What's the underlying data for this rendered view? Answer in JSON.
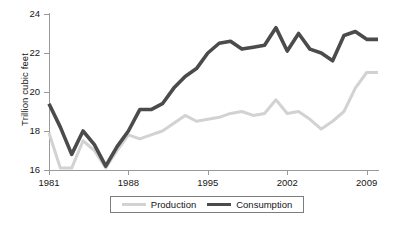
{
  "chart_data": {
    "type": "line",
    "title": "",
    "subtitle": "",
    "xlabel": "",
    "ylabel": "Trillion cubic feet",
    "xlim": [
      1981,
      2010
    ],
    "ylim": [
      16,
      24
    ],
    "grid": false,
    "legend_position": "bottom",
    "y_ticks": [
      16,
      18,
      20,
      22,
      24
    ],
    "x_ticks": [
      1981,
      1988,
      1995,
      2002,
      2009
    ],
    "x": [
      1981,
      1982,
      1983,
      1984,
      1985,
      1986,
      1987,
      1988,
      1989,
      1990,
      1991,
      1992,
      1993,
      1994,
      1995,
      1996,
      1997,
      1998,
      1999,
      2000,
      2001,
      2002,
      2003,
      2004,
      2005,
      2006,
      2007,
      2008,
      2009,
      2010
    ],
    "series": [
      {
        "name": "Production",
        "color": "#d2d2d2",
        "values": [
          17.9,
          16.1,
          16.1,
          17.5,
          17.0,
          16.1,
          17.0,
          17.8,
          17.6,
          17.8,
          18.0,
          18.4,
          18.8,
          18.5,
          18.6,
          18.7,
          18.9,
          19.0,
          18.8,
          18.9,
          19.6,
          18.9,
          19.0,
          18.6,
          18.1,
          18.5,
          19.0,
          20.2,
          21.0,
          21.0
        ],
        "style": "solid",
        "width": 3
      },
      {
        "name": "Consumption",
        "color": "#4b4b4b",
        "values": [
          19.4,
          18.2,
          16.8,
          18.0,
          17.3,
          16.2,
          17.2,
          18.0,
          19.1,
          19.1,
          19.4,
          20.2,
          20.8,
          21.2,
          22.0,
          22.5,
          22.6,
          22.2,
          22.3,
          22.4,
          23.3,
          22.1,
          23.0,
          22.2,
          22.0,
          21.6,
          22.9,
          23.1,
          22.7,
          22.7
        ],
        "style": "solid",
        "width": 3.6
      }
    ],
    "series_points": {
      "Production": [
        [
          1981,
          17.9
        ],
        [
          1982,
          16.1
        ],
        [
          1983,
          16.1
        ],
        [
          1984,
          17.5
        ],
        [
          1985,
          17.0
        ],
        [
          1986,
          16.1
        ],
        [
          1987,
          17.0
        ],
        [
          1988,
          17.8
        ],
        [
          1989,
          17.6
        ],
        [
          1990,
          17.8
        ],
        [
          1991,
          18.0
        ],
        [
          1992,
          18.4
        ],
        [
          1993,
          18.8
        ],
        [
          1994,
          18.5
        ],
        [
          1995,
          18.6
        ],
        [
          1996,
          18.7
        ],
        [
          1997,
          18.9
        ],
        [
          1998,
          19.0
        ],
        [
          1999,
          18.8
        ],
        [
          2000,
          18.9
        ],
        [
          2001,
          19.6
        ],
        [
          2002,
          18.9
        ],
        [
          2003,
          19.0
        ],
        [
          2004,
          18.6
        ],
        [
          2005,
          18.1
        ],
        [
          2006,
          18.5
        ],
        [
          2007,
          19.0
        ],
        [
          2008,
          20.2
        ],
        [
          2009,
          21.0
        ],
        [
          2010,
          21.0
        ]
      ],
      "Consumption": [
        [
          1981,
          19.4
        ],
        [
          1982,
          18.2
        ],
        [
          1983,
          16.8
        ],
        [
          1984,
          18.0
        ],
        [
          1985,
          17.3
        ],
        [
          1986,
          16.2
        ],
        [
          1987,
          17.2
        ],
        [
          1988,
          18.0
        ],
        [
          1989,
          19.1
        ],
        [
          1990,
          19.1
        ],
        [
          1991,
          19.4
        ],
        [
          1992,
          20.2
        ],
        [
          1993,
          20.8
        ],
        [
          1994,
          21.2
        ],
        [
          1995,
          22.0
        ],
        [
          1996,
          22.5
        ],
        [
          1997,
          22.6
        ],
        [
          1998,
          22.2
        ],
        [
          1999,
          22.3
        ],
        [
          2000,
          22.4
        ],
        [
          2001,
          23.3
        ],
        [
          2002,
          22.1
        ],
        [
          2003,
          23.0
        ],
        [
          2004,
          22.2
        ],
        [
          2005,
          22.0
        ],
        [
          2006,
          21.6
        ],
        [
          2007,
          22.9
        ],
        [
          2008,
          23.1
        ],
        [
          2009,
          22.7
        ],
        [
          2010,
          22.7
        ]
      ]
    }
  },
  "axis": {
    "y_title": "Trillion cubic feet",
    "y_tick_labels": [
      "24",
      "22",
      "20",
      "18",
      "16"
    ],
    "x_tick_labels": [
      "1981",
      "1988",
      "1995",
      "2002",
      "2009"
    ]
  },
  "legend": {
    "entries": [
      {
        "label": "Production",
        "color": "#d2d2d2"
      },
      {
        "label": "Consumption",
        "color": "#4b4b4b"
      }
    ]
  },
  "colors": {
    "production": "#d2d2d2",
    "consumption": "#4b4b4b",
    "axis": "#9a9a9a",
    "text": "#161616",
    "legend_border": "#7d7d7d",
    "background": "#ffffff"
  }
}
